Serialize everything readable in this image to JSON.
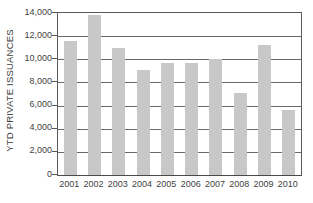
{
  "chart_data": {
    "type": "bar",
    "title": "",
    "subtitle": "",
    "xlabel": "",
    "ylabel": "YTD PRIVATE ISSUANCES",
    "categories": [
      "2001",
      "2002",
      "2003",
      "2004",
      "2005",
      "2006",
      "2007",
      "2008",
      "2009",
      "2010"
    ],
    "values": [
      11600,
      13800,
      11000,
      9100,
      9650,
      9650,
      10000,
      7100,
      11200,
      5600
    ],
    "ylim": [
      0,
      14000
    ],
    "ytick_values": [
      0,
      2000,
      4000,
      6000,
      8000,
      10000,
      12000,
      14000
    ],
    "ytick_labels": [
      "0",
      "2,000",
      "4,000",
      "6,000",
      "8,000",
      "10,000",
      "12,000",
      "14,000"
    ],
    "xtick_labels": [
      "2001",
      "2002",
      "2003",
      "2004",
      "2005",
      "2006",
      "2007",
      "2008",
      "2009",
      "2010"
    ],
    "grid": true,
    "grid_axis": "y",
    "legend": false,
    "legend_position": "none",
    "bar_color": "#c8c8c8",
    "axis_color": "#5a5a5a",
    "gridline_color": "#6b6b6b",
    "background_color": "#ffffff",
    "text_color": "#3f3f3f",
    "annotations": []
  }
}
